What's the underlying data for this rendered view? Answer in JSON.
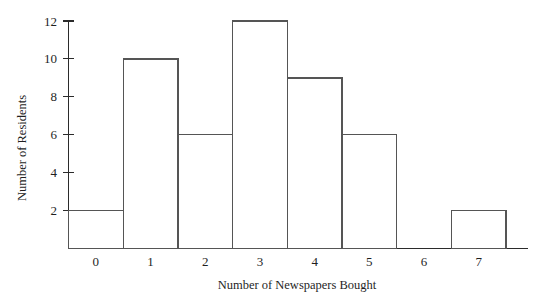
{
  "chart_data": {
    "type": "bar",
    "title": "",
    "xlabel": "Number of Newspapers Bought",
    "ylabel": "Number of Residents",
    "categories": [
      "0",
      "1",
      "2",
      "3",
      "4",
      "5",
      "6",
      "7"
    ],
    "values": [
      2,
      10,
      6,
      12,
      9,
      6,
      0,
      2
    ],
    "series": [
      {
        "name": "Number of Residents",
        "values": [
          2,
          10,
          6,
          12,
          9,
          6,
          0,
          2
        ]
      }
    ],
    "xlim": [
      -0.5,
      7.9
    ],
    "ylim": [
      0,
      12
    ],
    "y_ticks": [
      2,
      4,
      6,
      8,
      10,
      12
    ],
    "y_tick_labels": [
      "2",
      "4",
      "6",
      "8",
      "10",
      "12"
    ],
    "x_ticks": [
      0,
      1,
      2,
      3,
      4,
      5,
      6,
      7
    ],
    "x_tick_labels": [
      "0",
      "1",
      "2",
      "3",
      "4",
      "5",
      "6",
      "7"
    ],
    "grid": false,
    "legend": false,
    "legend_position": "none",
    "bar_fill": "#ffffff",
    "bar_edge_color": "#555555",
    "axis_color": "#2b2b2b",
    "background": "#ffffff",
    "annotations": []
  }
}
